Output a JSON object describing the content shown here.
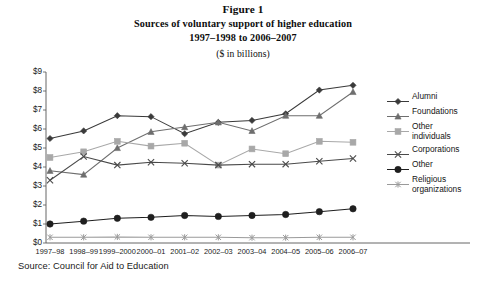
{
  "figure": {
    "title_lines": [
      "Figure 1",
      "Sources of voluntary support of higher education",
      "1997–1998 to 2006–2007",
      "($ in billions)"
    ],
    "source": "Source: Council for Aid to Education"
  },
  "chart_data": {
    "type": "line",
    "title": "Sources of voluntary support of higher education 1997–1998 to 2006–2007 ($ in billions)",
    "xlabel": "",
    "ylabel": "",
    "ylim": [
      0,
      9
    ],
    "ytick_labels": [
      "$9",
      "$8",
      "$7",
      "$6",
      "$5",
      "$4",
      "$3",
      "$2",
      "$1",
      "$0"
    ],
    "ytick_values": [
      9,
      8,
      7,
      6,
      5,
      4,
      3,
      2,
      1,
      0
    ],
    "grid": false,
    "legend_position": "right",
    "categories": [
      "1997–98",
      "1998–99",
      "1999–2000",
      "2000–01",
      "2001–02",
      "2002–03",
      "2003–04",
      "2004–05",
      "2005–06",
      "2006–07"
    ],
    "series": [
      {
        "name": "Alumni",
        "marker": "diamond",
        "color": "#3a3a3a",
        "values": [
          5.5,
          5.9,
          6.7,
          6.65,
          5.75,
          6.35,
          6.45,
          6.8,
          8.05,
          8.3
        ]
      },
      {
        "name": "Foundations",
        "marker": "triangle",
        "color": "#6e6e6e",
        "values": [
          3.8,
          3.6,
          5.0,
          5.85,
          6.1,
          6.35,
          5.9,
          6.7,
          6.7,
          7.95
        ]
      },
      {
        "name": "Other individuals",
        "marker": "square",
        "color": "#a8a8a8",
        "values": [
          4.5,
          4.8,
          5.35,
          5.1,
          5.25,
          4.1,
          4.95,
          4.7,
          5.35,
          5.3
        ]
      },
      {
        "name": "Corporations",
        "marker": "x",
        "color": "#4a4a4a",
        "values": [
          3.3,
          4.55,
          4.1,
          4.25,
          4.2,
          4.1,
          4.15,
          4.15,
          4.3,
          4.45
        ]
      },
      {
        "name": "Other",
        "marker": "circle",
        "color": "#1f1f1f",
        "values": [
          1.0,
          1.15,
          1.3,
          1.35,
          1.45,
          1.4,
          1.45,
          1.5,
          1.65,
          1.8
        ]
      },
      {
        "name": "Religious organizations",
        "marker": "asterisk",
        "color": "#9a9a9a",
        "values": [
          0.3,
          0.3,
          0.32,
          0.3,
          0.3,
          0.3,
          0.28,
          0.28,
          0.3,
          0.3
        ]
      }
    ]
  },
  "legend": {
    "entries": [
      {
        "label": "Alumni",
        "label2": ""
      },
      {
        "label": "Foundations",
        "label2": ""
      },
      {
        "label": "Other",
        "label2": "individuals"
      },
      {
        "label": "Corporations",
        "label2": ""
      },
      {
        "label": "Other",
        "label2": ""
      },
      {
        "label": "Religious",
        "label2": "organizations"
      }
    ]
  }
}
